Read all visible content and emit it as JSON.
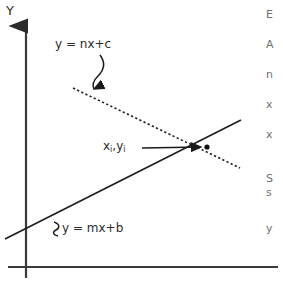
{
  "figure": {
    "type": "line-intersection-diagram",
    "background_color": "#ffffff",
    "stroke_color": "#2b2b2b",
    "axis_label_y": "Y",
    "axes": {
      "y_axis": {
        "x": 26,
        "y_top": 22,
        "y_bottom": 278,
        "arrow": "up"
      },
      "x_axis": {
        "y": 267,
        "x_left": 8,
        "x_right": 278
      }
    },
    "labels": {
      "line_dashed_label": "y = nx+c",
      "line_solid_label": "y = mx+b",
      "intersection_label_x": "x",
      "intersection_label_sub": "i",
      "intersection_label_sep": ",",
      "intersection_label_y": "y"
    },
    "lines": [
      {
        "name": "line-solid-mx-b",
        "equation": "y = mx+b",
        "style": "solid",
        "x1": 5,
        "y1": 239,
        "x2": 241,
        "y2": 120
      },
      {
        "name": "line-dashed-nx-c",
        "equation": "y = nx+c",
        "style": "dashed",
        "x1": 73,
        "y1": 88,
        "x2": 240,
        "y2": 168
      }
    ],
    "intersection_point": {
      "x": 207,
      "y": 147
    }
  },
  "side_text": {
    "lines": [
      "E",
      "A",
      "n",
      "x",
      "x",
      "S",
      "s",
      "y"
    ],
    "tops": [
      8,
      38,
      68,
      98,
      128,
      172,
      186,
      222
    ]
  }
}
